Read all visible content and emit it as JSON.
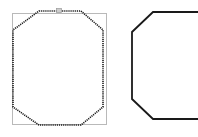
{
  "figure": {
    "background_color": "#ffffff",
    "width": 198,
    "height": 137
  },
  "chart_data": {
    "type": "diagram",
    "shapes": [
      {
        "name": "bounding-box-rectangle",
        "shape": "rectangle",
        "x": 12,
        "y": 13,
        "width": 95,
        "height": 112,
        "stroke": "#b9b9b9",
        "stroke_width": 1,
        "fill": "none",
        "stroke_style": "solid"
      },
      {
        "name": "left-octagon",
        "shape": "octagon",
        "stroke": "#1a1a1a",
        "stroke_width": 1.6,
        "fill": "none",
        "stroke_style": "dotted",
        "points": "39,11 81,11 103,30 103,107 81,125 39,125 13,107 13,30"
      },
      {
        "name": "top-edge-marker",
        "shape": "tick",
        "x": 57,
        "y": 9,
        "width": 5,
        "height": 4,
        "stroke": "#9a9a9a",
        "fill": "#cccccc"
      },
      {
        "name": "right-octagon",
        "shape": "octagon",
        "stroke": "#1a1a1a",
        "stroke_width": 1.8,
        "fill": "none",
        "stroke_style": "solid",
        "clipped_edge": "right",
        "points": "153,12 213,12 232,32 232,99 213,119 153,119 132,99 132,32"
      }
    ]
  }
}
